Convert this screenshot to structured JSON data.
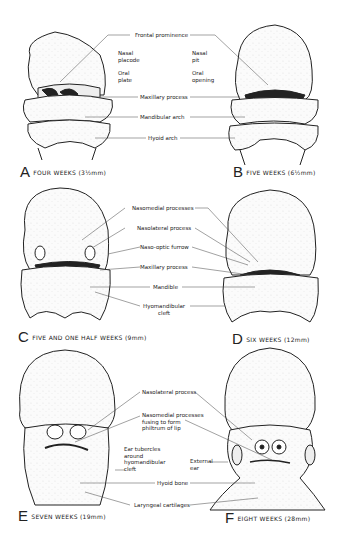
{
  "figure": {
    "panels": [
      {
        "letter": "A",
        "caption": "FOUR WEEKS (3½mm)"
      },
      {
        "letter": "B",
        "caption": "FIVE WEEKS (6½mm)"
      },
      {
        "letter": "C",
        "caption": "FIVE AND ONE HALF WEEKS (9mm)"
      },
      {
        "letter": "D",
        "caption": "SIX WEEKS (12mm)"
      },
      {
        "letter": "E",
        "caption": "SEVEN WEEKS (19mm)"
      },
      {
        "letter": "F",
        "caption": "EIGHT WEEKS (28mm)"
      }
    ],
    "labels_ab": {
      "frontal_prominence": "Frontal prominence",
      "nasal_placode_1": "Nasal",
      "nasal_placode_2": "placode",
      "oral_plate_1": "Oral",
      "oral_plate_2": "plate",
      "nasal_pit_1": "Nasal",
      "nasal_pit_2": "pit",
      "oral_opening_1": "Oral",
      "oral_opening_2": "opening",
      "maxillary_process": "Maxillary process",
      "mandibular_arch": "Mandibular arch",
      "hyoid_arch": "Hyoid arch"
    },
    "labels_cd": {
      "nasomedial_processes": "Nasomedial processes",
      "nasolateral_process": "Nasolateral process",
      "naso_optic_furrow": "Naso-optic furrow",
      "maxillary_process": "Maxillary process",
      "mandible": "Mandible",
      "hyomandibular_cleft_1": "Hyomandibular",
      "hyomandibular_cleft_2": "cleft"
    },
    "labels_ef": {
      "nasolateral_process": "Nasolateral process",
      "nasomedial_1": "Nasomedial processes",
      "nasomedial_2": "fusing to form",
      "nasomedial_3": "philtrum of lip",
      "ear_tubercles_1": "Ear tubercles",
      "ear_tubercles_2": "around",
      "ear_tubercles_3": "hyomandibular",
      "ear_tubercles_4": "cleft",
      "external_ear_1": "External",
      "external_ear_2": "ear",
      "hyoid_bone": "Hyoid bone",
      "laryngeal_cartilages": "Laryngeal cartilages"
    }
  }
}
